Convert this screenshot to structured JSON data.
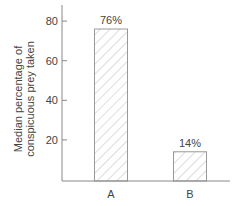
{
  "chart_data": {
    "type": "bar",
    "title": "",
    "xlabel": "",
    "ylabel": [
      "Median percentage of",
      "conspicuous prey taken"
    ],
    "categories": [
      "A",
      "B"
    ],
    "values": [
      76,
      14
    ],
    "data_labels": [
      "76%",
      "14%"
    ],
    "ylim": [
      0,
      88
    ],
    "yticks": [
      20,
      40,
      60,
      80
    ],
    "ytick_labels": [
      "20",
      "40",
      "60",
      "80"
    ],
    "grid": false,
    "legend": null,
    "bar_fill": "hatched",
    "colors": {
      "axis": "#888888",
      "bar_stroke": "#999999",
      "hatch": "#bbbbbb",
      "text": "#444444"
    }
  }
}
